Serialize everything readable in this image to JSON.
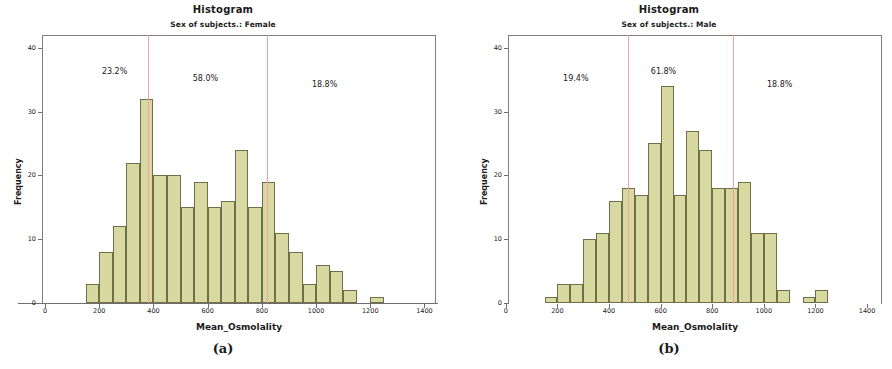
{
  "figure": {
    "panels": [
      {
        "caption": "(a)",
        "title": "Histogram",
        "subtitle": "Sex of subjects.: Female",
        "xlabel": "Mean_Osmolality",
        "ylabel": "Frequency",
        "annotations": [
          {
            "text": "23.2%"
          },
          {
            "text": "58.0%"
          },
          {
            "text": "18.8%"
          }
        ]
      },
      {
        "caption": "(b)",
        "title": "Histogram",
        "subtitle": "Sex of subjects.: Male",
        "xlabel": "Mean_Osmolality",
        "ylabel": "Frequency",
        "annotations": [
          {
            "text": "19.4%"
          },
          {
            "text": "61.8%"
          },
          {
            "text": "18.8%"
          }
        ]
      }
    ],
    "colors": {
      "bar_fill": "#d8d9a0",
      "bar_edge": "#6d6f46",
      "refline": "#f2a0a0",
      "axis": "#6f6f6f"
    }
  },
  "chart_data": [
    {
      "type": "bar",
      "title": "Histogram",
      "subtitle": "Sex of subjects.: Female",
      "xlabel": "Mean_Osmolality",
      "ylabel": "Frequency",
      "xlim": [
        -100,
        1450
      ],
      "ylim": [
        0,
        42
      ],
      "xticks": [
        0,
        200,
        400,
        600,
        800,
        1000,
        1200,
        1400
      ],
      "yticks": [
        0,
        10,
        20,
        30,
        40
      ],
      "grid": false,
      "legend": null,
      "bin_width": 50,
      "bin_starts": [
        150,
        200,
        250,
        300,
        350,
        400,
        450,
        500,
        550,
        600,
        650,
        700,
        750,
        800,
        850,
        900,
        950,
        1000,
        1050,
        1100,
        1200
      ],
      "values": [
        3,
        8,
        12,
        22,
        32,
        20,
        20,
        15,
        19,
        15,
        16,
        24,
        15,
        19,
        11,
        8,
        3,
        6,
        5,
        2,
        1
      ],
      "reflines": [
        380,
        820
      ],
      "annotations": [
        {
          "text": "23.2%",
          "x": 265,
          "y": 36
        },
        {
          "text": "58.0%",
          "x": 600,
          "y": 35
        },
        {
          "text": "18.8%",
          "x": 1040,
          "y": 34
        }
      ]
    },
    {
      "type": "bar",
      "title": "Histogram",
      "subtitle": "Sex of subjects.: Male",
      "xlabel": "Mean_Osmolality",
      "ylabel": "Frequency",
      "xlim": [
        -100,
        1450
      ],
      "ylim": [
        0,
        42
      ],
      "xticks": [
        0,
        200,
        400,
        600,
        800,
        1000,
        1200,
        1400
      ],
      "yticks": [
        0,
        10,
        20,
        30,
        40
      ],
      "grid": false,
      "legend": null,
      "bin_width": 50,
      "bin_starts": [
        150,
        200,
        250,
        300,
        350,
        400,
        450,
        500,
        550,
        600,
        650,
        700,
        750,
        800,
        850,
        900,
        950,
        1000,
        1050,
        1150,
        1200
      ],
      "values": [
        1,
        3,
        3,
        10,
        11,
        16,
        18,
        17,
        25,
        34,
        17,
        27,
        24,
        18,
        18,
        19,
        11,
        11,
        2,
        1,
        2
      ],
      "reflines": [
        475,
        880
      ],
      "annotations": [
        {
          "text": "19.4%",
          "x": 280,
          "y": 35
        },
        {
          "text": "61.8%",
          "x": 620,
          "y": 36
        },
        {
          "text": "18.8%",
          "x": 1070,
          "y": 34
        }
      ]
    }
  ]
}
